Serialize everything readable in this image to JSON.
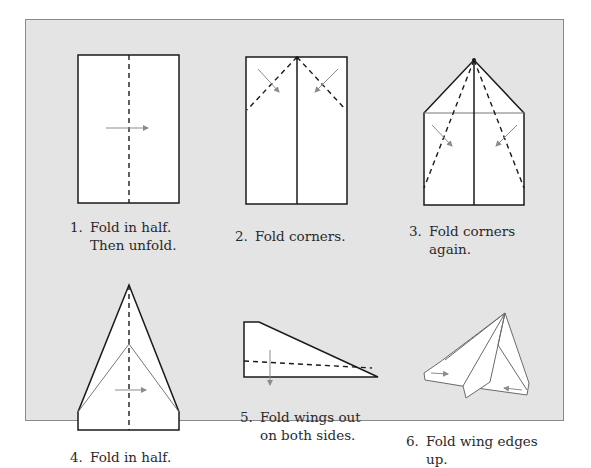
{
  "colors": {
    "panel": "#e4e4e4",
    "border": "#8a8a8a",
    "paper": "#ffffff",
    "line": "#1a1a1a",
    "arrow": "#8c8c8c",
    "text": "#2a2a2a"
  },
  "steps": [
    {
      "number": "1.",
      "text": "Fold in half.\nThen unfold.",
      "icon": "paper-rectangle-center-fold"
    },
    {
      "number": "2.",
      "text": "Fold corners.",
      "icon": "paper-corner-folds"
    },
    {
      "number": "3.",
      "text": "Fold corners\nagain.",
      "icon": "paper-second-corner-folds"
    },
    {
      "number": "4.",
      "text": "Fold in half.",
      "icon": "paper-triangle-fold-half"
    },
    {
      "number": "5.",
      "text": "Fold wings out\non both sides.",
      "icon": "paper-wing-fold"
    },
    {
      "number": "6.",
      "text": "Fold wing edges\nup.",
      "icon": "paper-airplane-finished"
    }
  ]
}
